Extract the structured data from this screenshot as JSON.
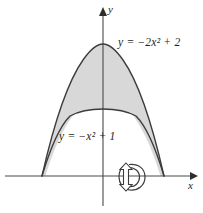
{
  "figure": {
    "background_color": "#ffffff",
    "curve_color": "#3b3b3b",
    "axis_color": "#4a4a4a",
    "shade_color": "#d8d8d8",
    "text_color": "#231f20"
  },
  "axes": {
    "x_label": "x",
    "y_label": "y",
    "x_axis": {
      "x_start": 5,
      "x_end": 196,
      "y": 176
    },
    "y_axis": {
      "x": 103,
      "y_start": 8,
      "y_end": 206
    },
    "origin": {
      "x": 103,
      "y": 176
    },
    "arrowheads": [
      "x-axis-right",
      "y-axis-up"
    ]
  },
  "curves": [
    {
      "name": "outer-parabola",
      "equation_text": "y = −2x² + 2",
      "equation_parts": {
        "lhs": "y",
        "eq": "=",
        "rhs_pre": "−2x",
        "exponent": "2",
        "rhs_post": "+ 2"
      },
      "a": -2,
      "c": 2,
      "roots": [
        -1,
        1
      ],
      "vertex": {
        "x": 0,
        "y": 2
      },
      "vertex_px": {
        "x": 103,
        "y": 44
      }
    },
    {
      "name": "inner-parabola",
      "equation_text": "y = −x² + 1",
      "equation_parts": {
        "lhs": "y",
        "eq": "=",
        "rhs_pre": "−x",
        "exponent": "2",
        "rhs_post": "+ 1"
      },
      "a": -1,
      "c": 1,
      "roots": [
        -1,
        1
      ],
      "vertex": {
        "x": 0,
        "y": 1
      },
      "vertex_px": {
        "x": 103,
        "y": 109
      }
    }
  ],
  "shaded_region": {
    "name": "region-between-curves",
    "between": [
      "inner-parabola",
      "outer-parabola"
    ],
    "fill": "#d8d8d8"
  },
  "revolution_arrow": {
    "name": "revolution-arrow",
    "about_axis": "x",
    "center_px": {
      "x": 133,
      "y": 177
    },
    "direction": "counterclockwise"
  },
  "intersections_px": {
    "left_root": {
      "x": 42,
      "y": 176
    },
    "right_root": {
      "x": 164,
      "y": 176
    }
  }
}
